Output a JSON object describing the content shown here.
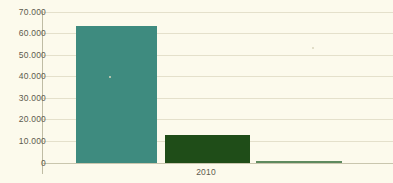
{
  "chart_data": {
    "type": "bar",
    "title": "",
    "xlabel": "",
    "ylabel": "",
    "categories": [
      "2010"
    ],
    "x_tick_labels": [
      "2010"
    ],
    "y_tick_labels": [
      "70.000",
      "60.000",
      "50.000",
      "40.000",
      "30.000",
      "20.000",
      "10.000",
      "0"
    ],
    "y_tick_values": [
      70000,
      60000,
      50000,
      40000,
      30000,
      20000,
      10000,
      0
    ],
    "ylim": [
      0,
      70000
    ],
    "grid": true,
    "legend": false,
    "series": [
      {
        "name": "series-1",
        "values": [
          63500
        ],
        "color": "#3E8B7F"
      },
      {
        "name": "series-2",
        "values": [
          13000
        ],
        "color": "#1F4D18"
      },
      {
        "name": "series-3",
        "values": [
          900
        ],
        "color": "#5E8A5E"
      }
    ],
    "bars": [
      {
        "name": "bar-1",
        "value": 63500,
        "color": "#3E8B7F",
        "left": 76,
        "width": 81
      },
      {
        "name": "bar-2",
        "value": 13000,
        "color": "#1F4D18",
        "left": 165,
        "width": 85
      },
      {
        "name": "bar-3",
        "value": 900,
        "color": "#5E8A5E",
        "left": 256,
        "width": 86
      }
    ]
  },
  "style": {
    "background": "#FCFAEC",
    "gridline_color": "#E4E0CB",
    "axis_color": "#BFBCA4",
    "tick_text_color": "#5C5A4E"
  }
}
